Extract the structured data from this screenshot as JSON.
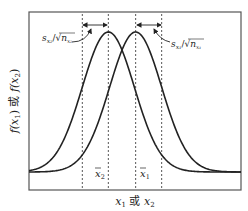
{
  "chart_data": {
    "type": "line",
    "title": "",
    "xlabel": "x₁ 或 x₂",
    "ylabel": "f(x₁) 或 f(x₂)",
    "x_range": [
      -3.05,
      5.1
    ],
    "grid": false,
    "series": [
      {
        "name": "f(x₂)",
        "distribution": "normal",
        "mean": 0,
        "sd": 1,
        "mean_label": "x̄₂",
        "sd_label": "s_{x₂}/√n_{x₂}"
      },
      {
        "name": "f(x₁)",
        "distribution": "normal",
        "mean": 1.05,
        "sd": 1,
        "mean_label": "x̄₁",
        "sd_label": "s_{x₁}/√n_{x₁}"
      }
    ],
    "annotations": {
      "left_sd": {
        "base": "s",
        "sub": "x₂",
        "sqrt_base": "n",
        "sqrt_sub": "x₂"
      },
      "right_sd": {
        "base": "s",
        "sub": "x₁",
        "sqrt_base": "n",
        "sqrt_sub": "x₁"
      },
      "mean2": {
        "base": "x",
        "sub": "2"
      },
      "mean1": {
        "base": "x",
        "sub": "1"
      }
    },
    "axis_label_parts": {
      "x": {
        "a": "x",
        "a_sub": "1",
        "mid": " 或 ",
        "b": "x",
        "b_sub": "2"
      },
      "y": {
        "a": "f(x",
        "a_sub": "1",
        "a_end": ")",
        "mid": " 或 ",
        "b": "f(x",
        "b_sub": "2",
        "b_end": ")"
      }
    }
  }
}
